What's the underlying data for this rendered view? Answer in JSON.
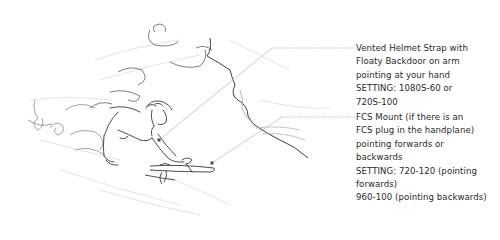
{
  "illustration": {
    "subject": "bodysurfer riding a wave with a handplane (pencil sketch)",
    "colors": {
      "sketch_stroke": "#3a3a3a",
      "sketch_light": "#9a9a9a",
      "leader_line": "#b5b5b5",
      "text": "#2a2a2a",
      "marker": "#444444"
    }
  },
  "callouts": [
    {
      "id": "helmet-strap",
      "marker": {
        "x": 159,
        "y": 140
      },
      "lines": [
        "Vented Helmet Strap with",
        "Floaty Backdoor on arm",
        "pointing at your hand",
        "SETTING: 1080S-60 or",
        "720S-100"
      ]
    },
    {
      "id": "fcs-mount",
      "marker": {
        "x": 212,
        "y": 163
      },
      "lines": [
        "FCS Mount (if there is an",
        "FCS plug in the handplane)",
        "pointing forwards or",
        "backwards",
        "SETTING: 720-120 (pointing",
        "forwards)",
        "960-100 (pointing backwards)"
      ]
    }
  ]
}
